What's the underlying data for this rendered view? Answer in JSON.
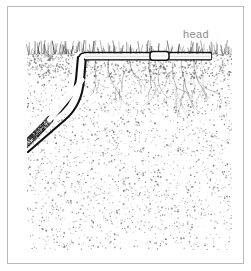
{
  "figure": {
    "type": "cross-section-illustration",
    "background_color": "#ffffff",
    "border_color": "#b9b9b9"
  },
  "annotations": {
    "head_label": "head",
    "head_label_color": "#8d8d8d"
  },
  "scene": {
    "soil": {
      "name": "soil-block",
      "left": 27,
      "top": 52,
      "right": 232,
      "bottom": 250,
      "fill": "#ffffff",
      "stipple_color": "#6b6b6b",
      "stipple_density": 2600
    },
    "grass": {
      "name": "grass-line",
      "surface_y": 54,
      "blade_count": 150,
      "color": "#4a4a4a"
    },
    "surface_pipe": {
      "name": "surface-lateral-pipe",
      "start_x": 84,
      "end_x": 211,
      "y": 56,
      "thickness": 7,
      "outline_color": "#111111",
      "fill": "#fbfbfb"
    },
    "sprinkler_head": {
      "name": "sprinkler-head-joint",
      "x": 150,
      "y": 56,
      "width": 18,
      "height": 8
    },
    "buried_hose": {
      "name": "buried-supply-hose",
      "exit_x": 27,
      "exit_y": 136,
      "bend_x": 74,
      "bend_y": 86,
      "join_x": 86,
      "join_y": 58,
      "dark_section_end_x": 64,
      "color": "#111111",
      "highlight": "#ffffff"
    },
    "roots": {
      "name": "grass-roots",
      "count": 7,
      "color": "#555555",
      "origins_x": [
        95,
        108,
        128,
        150,
        163,
        180,
        196
      ]
    }
  }
}
